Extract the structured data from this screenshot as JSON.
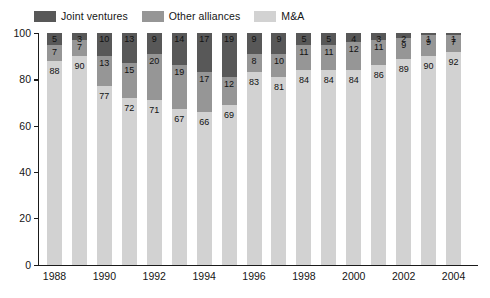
{
  "chart_data": {
    "type": "bar",
    "stacked": true,
    "title": "",
    "subtitle": "",
    "xlabel": "",
    "ylabel": "",
    "ylim": [
      0,
      100
    ],
    "yticks": [
      0,
      20,
      40,
      60,
      80,
      100
    ],
    "grid": false,
    "legend_position": "top-left",
    "categories": [
      "1988",
      "1989",
      "1990",
      "1991",
      "1992",
      "1993",
      "1994",
      "1995",
      "1996",
      "1997",
      "1998",
      "1999",
      "2000",
      "2001",
      "2002",
      "2003",
      "2004"
    ],
    "tick_labels": [
      "1988",
      "1990",
      "1992",
      "1994",
      "1996",
      "1998",
      "2000",
      "2002",
      "2004"
    ],
    "series": [
      {
        "name": "M&A",
        "color": "#d2d2d2",
        "values": [
          88,
          90,
          77,
          72,
          71,
          67,
          66,
          69,
          83,
          81,
          84,
          84,
          84,
          86,
          89,
          90,
          92
        ]
      },
      {
        "name": "Other alliances",
        "color": "#969696",
        "values": [
          7,
          7,
          13,
          15,
          20,
          19,
          17,
          12,
          8,
          10,
          11,
          11,
          12,
          11,
          9,
          9,
          7
        ]
      },
      {
        "name": "Joint ventures",
        "color": "#585858",
        "values": [
          5,
          3,
          10,
          13,
          9,
          14,
          17,
          19,
          9,
          9,
          5,
          5,
          4,
          3,
          2,
          1,
          1
        ]
      }
    ]
  },
  "legend": {
    "items": [
      {
        "label": "Joint ventures",
        "color": "#585858"
      },
      {
        "label": "Other alliances",
        "color": "#969696"
      },
      {
        "label": "M&A",
        "color": "#d2d2d2"
      }
    ]
  },
  "axes": {
    "y_max_label": "100",
    "y_min_label": "0"
  }
}
